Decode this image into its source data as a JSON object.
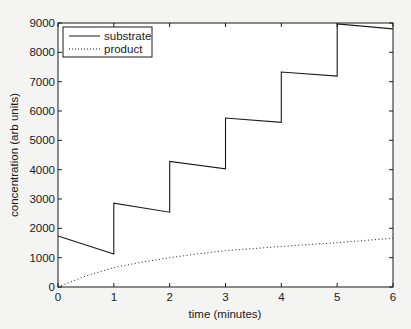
{
  "chart_data": {
    "type": "line",
    "title": "",
    "xlabel": "time (minutes)",
    "ylabel": "concentration (arb units)",
    "xlim": [
      0,
      6
    ],
    "ylim": [
      0,
      9000
    ],
    "xticks": [
      0,
      1,
      2,
      3,
      4,
      5,
      6
    ],
    "yticks": [
      0,
      1000,
      2000,
      3000,
      4000,
      5000,
      6000,
      7000,
      8000,
      9000
    ],
    "grid": false,
    "legend_position": "upper left",
    "series": [
      {
        "name": "substrate",
        "style": "solid",
        "color": "#1a1a1a",
        "points": [
          [
            0,
            1740
          ],
          [
            1,
            1120
          ],
          [
            1,
            2860
          ],
          [
            2,
            2550
          ],
          [
            2,
            4280
          ],
          [
            3,
            4030
          ],
          [
            3,
            5760
          ],
          [
            4,
            5610
          ],
          [
            4,
            7330
          ],
          [
            5,
            7190
          ],
          [
            5,
            8970
          ],
          [
            6,
            8800
          ]
        ]
      },
      {
        "name": "product",
        "style": "dotted",
        "color": "#1a1a1a",
        "points": [
          [
            0,
            0
          ],
          [
            0.5,
            380
          ],
          [
            1,
            660
          ],
          [
            1.5,
            850
          ],
          [
            2,
            1000
          ],
          [
            2.5,
            1130
          ],
          [
            3,
            1240
          ],
          [
            3.5,
            1310
          ],
          [
            4,
            1380
          ],
          [
            4.5,
            1450
          ],
          [
            5,
            1510
          ],
          [
            5.5,
            1590
          ],
          [
            6,
            1660
          ]
        ]
      }
    ]
  }
}
